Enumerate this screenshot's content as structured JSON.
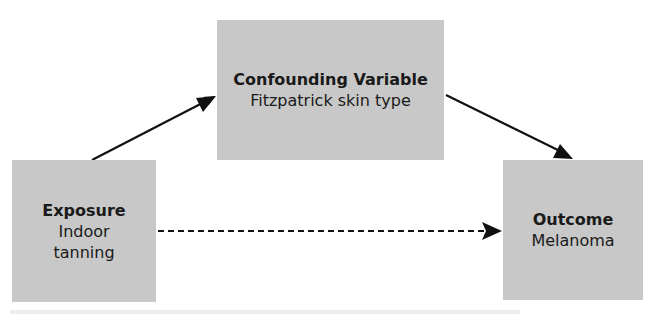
{
  "diagram": {
    "type": "causal-dag",
    "nodes": [
      {
        "id": "confounder",
        "title": "Confounding Variable",
        "label": "Fitzpatrick skin type"
      },
      {
        "id": "exposure",
        "title": "Exposure",
        "label": "Indoor tanning"
      },
      {
        "id": "outcome",
        "title": "Outcome",
        "label": "Melanoma"
      }
    ],
    "edges": [
      {
        "from": "exposure",
        "to": "confounder",
        "style": "solid"
      },
      {
        "from": "confounder",
        "to": "outcome",
        "style": "solid"
      },
      {
        "from": "exposure",
        "to": "outcome",
        "style": "dashed"
      }
    ],
    "colors": {
      "box_fill": "#c8c8c8",
      "arrow": "#111111",
      "background": "#ffffff"
    }
  }
}
